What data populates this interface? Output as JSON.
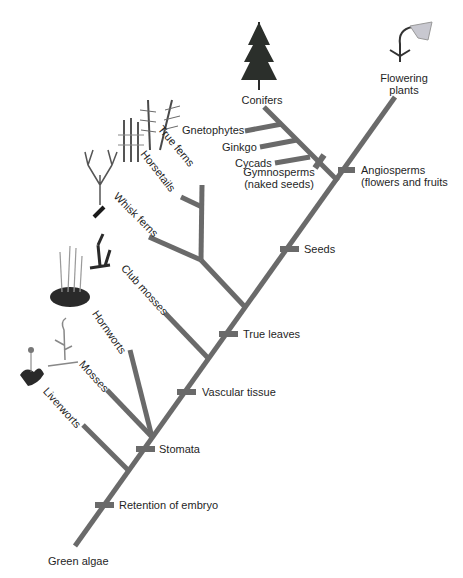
{
  "diagram": {
    "title": "",
    "type": "phylogenetic-tree",
    "line_color": "#6a6a6a",
    "root": "Green algae",
    "taxa": [
      {
        "id": "liverworts",
        "label": "Liverworts"
      },
      {
        "id": "mosses",
        "label": "Mosses"
      },
      {
        "id": "hornworts",
        "label": "Hornworts"
      },
      {
        "id": "club_mosses",
        "label": "Club mosses"
      },
      {
        "id": "whisk_ferns",
        "label": "Whisk ferns"
      },
      {
        "id": "horsetails",
        "label": "Horsetails"
      },
      {
        "id": "true_ferns",
        "label": "True ferns"
      },
      {
        "id": "gnetophytes",
        "label": "Gnetophytes"
      },
      {
        "id": "ginkgo",
        "label": "Ginkgo"
      },
      {
        "id": "cycads",
        "label": "Cycads"
      },
      {
        "id": "conifers",
        "label": "Conifers"
      },
      {
        "id": "flowering_plants",
        "label_line1": "Flowering",
        "label_line2": "plants"
      }
    ],
    "traits": [
      {
        "id": "retention_of_embryo",
        "label": "Retention of embryo"
      },
      {
        "id": "stomata",
        "label": "Stomata"
      },
      {
        "id": "vascular_tissue",
        "label": "Vascular tissue"
      },
      {
        "id": "true_leaves",
        "label": "True leaves"
      },
      {
        "id": "seeds",
        "label": "Seeds"
      },
      {
        "id": "angiosperms",
        "label_line1": "Angiosperms",
        "label_line2": "(flowers and fruits"
      },
      {
        "id": "gymnosperms",
        "label_line1": "Gymnosperms",
        "label_line2": "(naked seeds)"
      }
    ]
  }
}
